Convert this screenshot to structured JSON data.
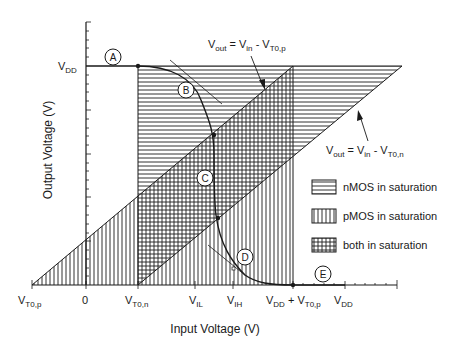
{
  "chart": {
    "type": "diagram",
    "xlabel": "Input Voltage  (V)",
    "ylabel": "Output Voltage  (V)",
    "y_ticks": [
      {
        "main": "V",
        "sub": "DD"
      }
    ],
    "x_ticks": [
      {
        "main": "V",
        "sub": "T0,p",
        "suffix": ""
      },
      {
        "main": "0",
        "sub": "",
        "suffix": ""
      },
      {
        "main": "V",
        "sub": "T0,n",
        "suffix": ""
      },
      {
        "main": "V",
        "sub": "IL",
        "suffix": ""
      },
      {
        "main": "V",
        "sub": "IH",
        "suffix": ""
      },
      {
        "main": "V",
        "sub": "DD",
        "suffix": " + V",
        "sub2": "T0,p"
      },
      {
        "main": "V",
        "sub": "DD",
        "suffix": ""
      }
    ],
    "annotations": {
      "line_p": {
        "lhs": "V",
        "lhs_sub": "out",
        "eq": " = V",
        "mid_sub": "in",
        "minus": " - V",
        "rhs_sub": "T0,p"
      },
      "line_n": {
        "lhs": "V",
        "lhs_sub": "out",
        "eq": " = V",
        "mid_sub": "in",
        "minus": " - V",
        "rhs_sub": "T0,n"
      }
    },
    "region_points": [
      "A",
      "B",
      "C",
      "D",
      "E"
    ],
    "legend": [
      {
        "pattern": "horizontal",
        "label": "nMOS in saturation"
      },
      {
        "pattern": "vertical",
        "label": "pMOS in saturation"
      },
      {
        "pattern": "crosshatch",
        "label": "both in saturation"
      }
    ],
    "colors": {
      "ink": "#1a1a1a",
      "background": "#ffffff"
    }
  }
}
